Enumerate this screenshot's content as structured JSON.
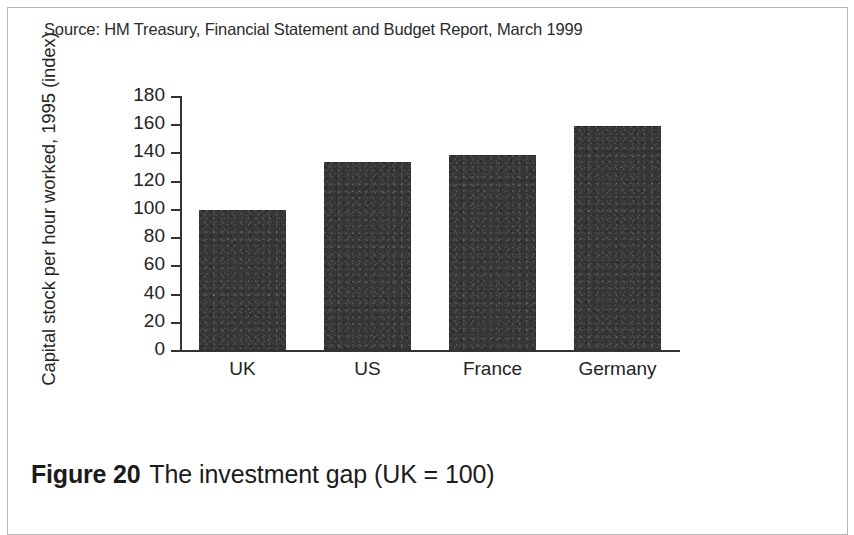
{
  "figure": {
    "caption_number": "Figure 20",
    "caption_text": "The investment gap (UK = 100)"
  },
  "chart_data": {
    "type": "bar",
    "title": "",
    "subtitle": "",
    "categories": [
      "UK",
      "US",
      "France",
      "Germany"
    ],
    "values": [
      99,
      133,
      138,
      159
    ],
    "xlabel": "",
    "ylabel": "Capital stock per hour worked, 1995 (index)",
    "ylim": [
      0,
      180
    ],
    "ytick_labels": [
      "0",
      "20",
      "40",
      "60",
      "80",
      "100",
      "120",
      "140",
      "160",
      "180"
    ],
    "ytick_values": [
      0,
      20,
      40,
      60,
      80,
      100,
      120,
      140,
      160,
      180
    ],
    "grid": false,
    "legend": false,
    "annotation": "Source: HM Treasury, Financial Statement and Budget Report, March 1999",
    "bar_color": "#373737",
    "axis_color": "#333333",
    "background_color": "#ffffff"
  }
}
